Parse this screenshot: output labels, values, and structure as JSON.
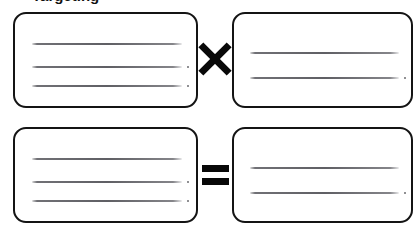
{
  "page": {
    "title_partial": "Targeting",
    "background_color": "#ffffff",
    "ink_color": "#141414"
  },
  "diagram": {
    "type": "equation-layout",
    "operator_symbols": {
      "times": "×",
      "equals": "="
    },
    "boxes": [
      {
        "id": "top-left",
        "name": "top-left-box",
        "position": "top-left",
        "redacted_line_count": 3,
        "redacted_lines": [
          "",
          "",
          ""
        ]
      },
      {
        "id": "top-right",
        "name": "top-right-box",
        "position": "top-right",
        "redacted_line_count": 2,
        "redacted_lines": [
          "",
          ""
        ]
      },
      {
        "id": "bottom-left",
        "name": "bottom-left-box",
        "position": "bottom-left",
        "redacted_line_count": 3,
        "redacted_lines": [
          "",
          "",
          ""
        ]
      },
      {
        "id": "bottom-right",
        "name": "bottom-right-box",
        "position": "bottom-right",
        "redacted_line_count": 2,
        "redacted_lines": [
          "",
          ""
        ]
      }
    ],
    "operators": [
      {
        "id": "times-operator",
        "symbol": "×",
        "between": [
          "top-left",
          "top-right"
        ]
      },
      {
        "id": "equals-operator",
        "symbol": "=",
        "between": [
          "bottom-left",
          "bottom-right"
        ]
      }
    ]
  }
}
